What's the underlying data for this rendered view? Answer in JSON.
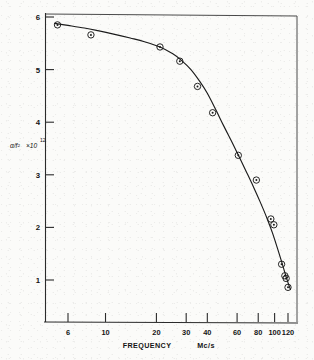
{
  "chart_data": {
    "type": "scatter",
    "title": "",
    "xlabel": "FREQUENCY",
    "xunits": "Mc/s",
    "ylabel_symbol": "α/f²",
    "ylabel_scale_base": "×10",
    "ylabel_scale_exp": "12",
    "xscale": "log",
    "yscale": "linear",
    "xlim": [
      5,
      128
    ],
    "ylim": [
      0.45,
      6.08
    ],
    "grid": false,
    "legend": null,
    "xticks": [
      6,
      10,
      20,
      30,
      40,
      60,
      80,
      100,
      120
    ],
    "xticklabels": [
      "6",
      "10",
      "20",
      "30",
      "40",
      "60",
      "80",
      "100",
      "120"
    ],
    "yticks": [
      1,
      2,
      3,
      4,
      5,
      6
    ],
    "yticklabels": [
      "1",
      "2",
      "3",
      "4",
      "5",
      "6"
    ],
    "marker": "circle-with-center-dot",
    "series": [
      {
        "name": "alpha over f squared",
        "x": [
          5.2,
          8.2,
          21.0,
          27.5,
          35.0,
          43.0,
          61.0,
          78.0,
          95.0,
          99.0,
          110.0,
          115.0,
          117.0,
          120.0
        ],
        "values": [
          5.85,
          5.66,
          5.43,
          5.16,
          4.68,
          4.18,
          3.37,
          2.9,
          2.16,
          2.05,
          1.3,
          1.08,
          1.03,
          0.86
        ]
      }
    ],
    "curve_x": [
      5.0,
      6.0,
      7.5,
      9.0,
      11.0,
      14.0,
      17.0,
      21.0,
      25.0,
      28.0,
      32.0,
      36.0,
      40.0,
      45.0,
      50.0,
      56.0,
      62.0,
      68.0,
      75.0,
      82.0,
      90.0,
      97.0,
      104.0,
      110.0,
      115.0,
      120.0,
      124.0
    ],
    "curve_y": [
      5.88,
      5.84,
      5.79,
      5.74,
      5.68,
      5.6,
      5.53,
      5.43,
      5.3,
      5.18,
      5.0,
      4.78,
      4.55,
      4.23,
      3.93,
      3.62,
      3.33,
      3.06,
      2.77,
      2.49,
      2.18,
      1.9,
      1.6,
      1.35,
      1.14,
      0.95,
      0.82
    ]
  },
  "axes": {
    "x_title": "FREQUENCY",
    "x_units": "Mc/s"
  }
}
